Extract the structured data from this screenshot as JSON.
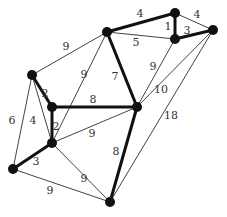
{
  "graph": {
    "nodes": [
      {
        "id": "A",
        "x": 32,
        "y": 75
      },
      {
        "id": "B",
        "x": 107,
        "y": 32
      },
      {
        "id": "C",
        "x": 175,
        "y": 13
      },
      {
        "id": "D",
        "x": 175,
        "y": 39
      },
      {
        "id": "E",
        "x": 213,
        "y": 30
      },
      {
        "id": "F",
        "x": 52,
        "y": 107
      },
      {
        "id": "G",
        "x": 137,
        "y": 107
      },
      {
        "id": "H",
        "x": 52,
        "y": 143
      },
      {
        "id": "I",
        "x": 13,
        "y": 169
      },
      {
        "id": "J",
        "x": 110,
        "y": 202
      }
    ],
    "edges": [
      {
        "from": "B",
        "to": "C",
        "weight": "4",
        "bold": true,
        "lx": 140,
        "ly": 17
      },
      {
        "from": "C",
        "to": "E",
        "weight": "4",
        "bold": false,
        "lx": 197,
        "ly": 18
      },
      {
        "from": "C",
        "to": "D",
        "weight": "1",
        "bold": true,
        "lx": 168,
        "ly": 30
      },
      {
        "from": "D",
        "to": "E",
        "weight": "3",
        "bold": true,
        "lx": 187,
        "ly": 34
      },
      {
        "from": "B",
        "to": "D",
        "weight": "5",
        "bold": false,
        "lx": 136,
        "ly": 46
      },
      {
        "from": "A",
        "to": "B",
        "weight": "9",
        "bold": false,
        "lx": 66,
        "ly": 50
      },
      {
        "from": "B",
        "to": "H",
        "weight": "9",
        "bold": false,
        "lx": 84,
        "ly": 78
      },
      {
        "from": "B",
        "to": "G",
        "weight": "7",
        "bold": true,
        "lx": 115,
        "ly": 80
      },
      {
        "from": "D",
        "to": "G",
        "weight": "9",
        "bold": false,
        "lx": 153,
        "ly": 70
      },
      {
        "from": "E",
        "to": "G",
        "weight": "10",
        "bold": false,
        "lx": 161,
        "ly": 93
      },
      {
        "from": "E",
        "to": "J",
        "weight": "18",
        "bold": false,
        "lx": 171,
        "ly": 119
      },
      {
        "from": "A",
        "to": "F",
        "weight": "2",
        "bold": true,
        "lx": 45,
        "ly": 97
      },
      {
        "from": "F",
        "to": "G",
        "weight": "8",
        "bold": true,
        "lx": 93,
        "ly": 103
      },
      {
        "from": "F",
        "to": "H",
        "weight": "2",
        "bold": true,
        "lx": 56,
        "ly": 130
      },
      {
        "from": "H",
        "to": "G",
        "weight": "9",
        "bold": false,
        "lx": 92,
        "ly": 137
      },
      {
        "from": "A",
        "to": "I",
        "weight": "6",
        "bold": false,
        "lx": 12,
        "ly": 124
      },
      {
        "from": "A",
        "to": "H",
        "weight": "4",
        "bold": false,
        "lx": 33,
        "ly": 124
      },
      {
        "from": "H",
        "to": "I",
        "weight": "3",
        "bold": true,
        "lx": 36,
        "ly": 165
      },
      {
        "from": "H",
        "to": "J",
        "weight": "9",
        "bold": false,
        "lx": 84,
        "ly": 182
      },
      {
        "from": "G",
        "to": "J",
        "weight": "8",
        "bold": true,
        "lx": 116,
        "ly": 155
      },
      {
        "from": "I",
        "to": "J",
        "weight": "9",
        "bold": false,
        "lx": 50,
        "ly": 194
      }
    ]
  }
}
